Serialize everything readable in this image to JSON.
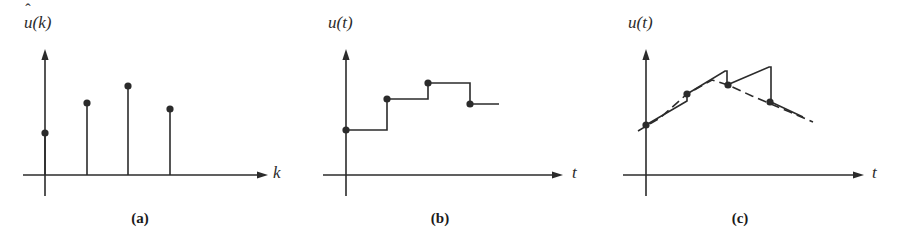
{
  "figure": {
    "background": "#ffffff",
    "ink_color": "#2b2b2b",
    "width": 900,
    "height": 238
  },
  "panels": [
    {
      "id": "a",
      "caption": "(a)",
      "caption_x": 140,
      "caption_y": 211,
      "y_axis_label": "u(k)",
      "y_axis_label_base": "u",
      "y_axis_label_hat": "ˆ",
      "y_axis_label_arg": "(k)",
      "y_axis_label_x": 24,
      "y_axis_label_y": 22,
      "x_axis_label": "k",
      "x_axis_label_x": 273,
      "x_axis_label_y": 164,
      "plot_type": "stem",
      "origin": {
        "x": 45,
        "y": 175
      },
      "y_axis_top": 49,
      "y_axis_bottom": 196,
      "x_axis_left": 23,
      "x_axis_right": 268,
      "stems": [
        {
          "k": 0,
          "x": 45,
          "y": 133
        },
        {
          "k": 1,
          "x": 87,
          "y": 103
        },
        {
          "k": 2,
          "x": 128,
          "y": 86
        },
        {
          "k": 3,
          "x": 170,
          "y": 109
        }
      ]
    },
    {
      "id": "b",
      "caption": "(b)",
      "caption_x": 440,
      "caption_y": 211,
      "y_axis_label": "u(t)",
      "y_axis_label_base": "u",
      "y_axis_label_hat": "",
      "y_axis_label_arg": "(t)",
      "y_axis_label_x": 328,
      "y_axis_label_y": 22,
      "x_axis_label": "t",
      "x_axis_label_x": 572,
      "x_axis_label_y": 164,
      "plot_type": "zero-order-hold",
      "origin": {
        "x": 346,
        "y": 175
      },
      "y_axis_top": 49,
      "y_axis_bottom": 196,
      "x_axis_left": 323,
      "x_axis_right": 563,
      "samples": [
        {
          "k": 0,
          "x": 346,
          "y": 130
        },
        {
          "k": 1,
          "x": 387,
          "y": 99
        },
        {
          "k": 2,
          "x": 428,
          "y": 83
        },
        {
          "k": 3,
          "x": 470,
          "y": 104
        }
      ],
      "hold_end_x": 499
    },
    {
      "id": "c",
      "caption": "(c)",
      "caption_x": 740,
      "caption_y": 211,
      "y_axis_label": "u(t)",
      "y_axis_label_base": "u",
      "y_axis_label_hat": "",
      "y_axis_label_arg": "(t)",
      "y_axis_label_x": 628,
      "y_axis_label_y": 22,
      "x_axis_label": "t",
      "x_axis_label_x": 872,
      "x_axis_label_y": 164,
      "plot_type": "first-order-hold",
      "origin": {
        "x": 646,
        "y": 175
      },
      "y_axis_top": 49,
      "y_axis_bottom": 196,
      "x_axis_left": 623,
      "x_axis_right": 864,
      "samples": [
        {
          "k": 0,
          "x": 646,
          "y": 125
        },
        {
          "k": 1,
          "x": 687,
          "y": 94
        },
        {
          "k": 2,
          "x": 728,
          "y": 85
        },
        {
          "k": 3,
          "x": 770,
          "y": 102
        }
      ],
      "solid_path": "M 646,125 L 687,101 L 687,94 L 725,71 L 727,71 L 727,85 L 769,67 L 771,67 L 771,102 L 803,117",
      "dashed_path": "M 638,131 L 660,118 L 687,94 L 712,80 L 728,85 L 752,96 L 790,112 L 813,122",
      "dash_pattern": "9 5"
    }
  ],
  "style": {
    "line_width": 1.6,
    "axis_width": 1.6,
    "dot_radius": 3.6,
    "arrow_length": 11,
    "arrow_half_width": 3.6
  },
  "chart_data": {
    "type": "line",
    "panels": [
      {
        "label": "(a)",
        "type": "stem",
        "ylabel": "u-hat(k)",
        "xlabel": "k",
        "x": [
          0,
          1,
          2,
          3
        ],
        "values": [
          0.4,
          0.72,
          0.89,
          0.66
        ]
      },
      {
        "label": "(b)",
        "type": "step",
        "ylabel": "u(t)",
        "xlabel": "t",
        "x": [
          0,
          1,
          2,
          3
        ],
        "values": [
          0.43,
          0.73,
          0.89,
          0.69
        ]
      },
      {
        "label": "(c)",
        "type": "line",
        "ylabel": "u(t)",
        "xlabel": "t",
        "x": [
          0,
          1,
          2,
          3
        ],
        "values": [
          0.47,
          0.77,
          0.86,
          0.7
        ],
        "series": [
          {
            "name": "first-order hold (solid sawtooth)",
            "values": [
              0.47,
              0.77,
              0.86,
              0.7
            ]
          },
          {
            "name": "underlying signal (dashed)",
            "values": [
              0.47,
              0.77,
              0.86,
              0.7
            ]
          }
        ]
      }
    ],
    "grid": false,
    "legend": "none"
  }
}
